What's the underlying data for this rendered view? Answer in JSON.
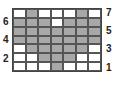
{
  "chart": {
    "columns": 7,
    "rows": 7,
    "cells": [
      [
        0,
        1,
        0,
        0,
        0,
        1,
        0
      ],
      [
        1,
        1,
        1,
        0,
        1,
        1,
        1
      ],
      [
        1,
        1,
        1,
        1,
        1,
        1,
        1
      ],
      [
        1,
        1,
        1,
        1,
        1,
        1,
        1
      ],
      [
        0,
        1,
        1,
        1,
        1,
        1,
        0
      ],
      [
        0,
        0,
        1,
        1,
        1,
        0,
        0
      ],
      [
        0,
        0,
        0,
        1,
        0,
        0,
        0
      ]
    ],
    "colors": {
      "filled": "#a8a8a8",
      "empty": "#ffffff"
    }
  },
  "labels": {
    "left": [
      {
        "text": "6",
        "row": 6
      },
      {
        "text": "4",
        "row": 4
      },
      {
        "text": "2",
        "row": 2
      }
    ],
    "right": [
      {
        "text": "7",
        "row": 7
      },
      {
        "text": "5",
        "row": 5
      },
      {
        "text": "3",
        "row": 3
      },
      {
        "text": "1",
        "row": 1
      }
    ]
  }
}
